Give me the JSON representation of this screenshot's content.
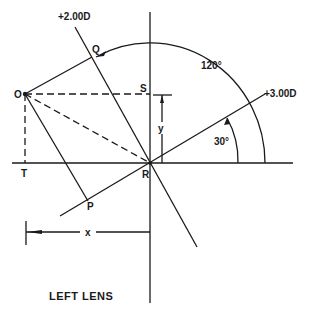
{
  "diagram": {
    "title": "LEFT LENS",
    "axes": {
      "meridian_1": "+2.00D",
      "meridian_2": "+3.00D"
    },
    "angles": {
      "large_arc": "120°",
      "small_arc": "30°"
    },
    "points": {
      "O": "O",
      "Q": "Q",
      "S": "S",
      "R": "R",
      "T": "T",
      "P": "P"
    },
    "dimensions": {
      "x": "x",
      "y": "y"
    },
    "colors": {
      "ink": "#1a1a1a",
      "background": "#ffffff"
    }
  }
}
